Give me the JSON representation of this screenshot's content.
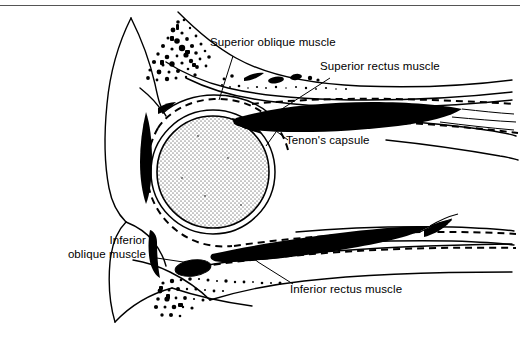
{
  "figure": {
    "background_color": "#ffffff",
    "ink_color": "#000000",
    "globe_fill_color": "#b8b8b8"
  },
  "labels": {
    "superior_oblique": "Superior oblique muscle",
    "superior_rectus": "Superior rectus muscle",
    "tenons_capsule": "Tenon's capsule",
    "inferior_oblique_line1": "Inferior",
    "inferior_oblique_line2": "oblique muscle",
    "inferior_rectus": "Inferior rectus muscle"
  }
}
